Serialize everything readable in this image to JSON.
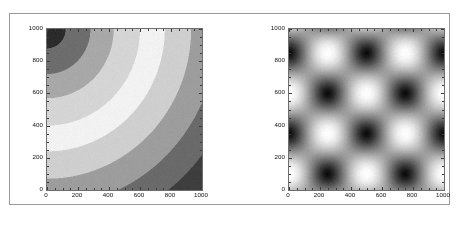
{
  "figure": {
    "background_color": "#ffffff",
    "frame_color": "#9a9a9a",
    "axis_color": "#6e6e6e",
    "tick_label_color": "#111111"
  },
  "panels": [
    {
      "name": "left-contour-panel",
      "xticks": [
        "0",
        "200",
        "400",
        "600",
        "800",
        "1000"
      ],
      "yticks": [
        "0",
        "200",
        "400",
        "600",
        "800",
        "1000"
      ]
    },
    {
      "name": "right-periodic-panel",
      "xticks": [
        "0",
        "200",
        "400",
        "600",
        "800",
        "1000"
      ],
      "yticks": [
        "0",
        "200",
        "400",
        "600",
        "800",
        "1000"
      ]
    }
  ],
  "chart_data": [
    {
      "type": "heatmap",
      "title": "",
      "xlabel": "",
      "ylabel": "",
      "xlim": [
        0,
        1000
      ],
      "ylim": [
        1000,
        0
      ],
      "xticks": [
        0,
        200,
        400,
        600,
        800,
        1000
      ],
      "yticks": [
        0,
        200,
        400,
        600,
        800,
        1000
      ],
      "grid": false,
      "legend": "none",
      "colormap": "gray",
      "quantized_levels": 10,
      "description": "Banded concentric quarter-arc contour field; value increases radially from the lower-left origin, quantized into discrete gray bands from near-white (inner) through mid-gray to near-black (upper-right).",
      "field": {
        "expression": "hypot(x, 1000 - y)",
        "origin": [
          0,
          1000
        ],
        "band_width": 200,
        "levels": [
          {
            "index": 0,
            "radius_range": [
              0,
              120
            ],
            "gray": "#2b2b2b"
          },
          {
            "index": 1,
            "radius_range": [
              120,
              280
            ],
            "gray": "#6d6d6d"
          },
          {
            "index": 2,
            "radius_range": [
              280,
              430
            ],
            "gray": "#a8a8a8"
          },
          {
            "index": 3,
            "radius_range": [
              430,
              600
            ],
            "gray": "#d5d5d5"
          },
          {
            "index": 4,
            "radius_range": [
              600,
              760
            ],
            "gray": "#f2f2f2"
          },
          {
            "index": 5,
            "radius_range": [
              760,
              930
            ],
            "gray": "#cfcfcf"
          },
          {
            "index": 6,
            "radius_range": [
              930,
              1100
            ],
            "gray": "#9d9d9d"
          },
          {
            "index": 7,
            "radius_range": [
              1100,
              1270
            ],
            "gray": "#6a6a6a"
          },
          {
            "index": 8,
            "radius_range": [
              1270,
              1440
            ],
            "gray": "#3e3e3e"
          },
          {
            "index": 9,
            "radius_range": [
              1440,
              2000
            ],
            "gray": "#1c1c1c"
          }
        ]
      }
    },
    {
      "type": "heatmap",
      "title": "",
      "xlabel": "",
      "ylabel": "",
      "xlim": [
        0,
        1000
      ],
      "ylim": [
        1000,
        0
      ],
      "xticks": [
        0,
        200,
        400,
        600,
        800,
        1000
      ],
      "yticks": [
        0,
        200,
        400,
        600,
        800,
        1000
      ],
      "grid": false,
      "legend": "none",
      "colormap": "gray",
      "description": "Smooth doubly-periodic checkerboard field of alternating dark and light blobs; product of two sinusoids with period 500 in x and 500 in y, phase shifted so dark minima and light maxima interleave diagonally.",
      "field": {
        "expression": "cos(2*pi*(x-250)/500) * cos(2*pi*(y-100)/500)",
        "period_x": 500,
        "period_y": 500,
        "phase_x": 250,
        "phase_y": 100,
        "dark_blob_centers": [
          [
            250,
            100
          ],
          [
            750,
            100
          ],
          [
            0,
            350
          ],
          [
            500,
            350
          ],
          [
            1000,
            350
          ],
          [
            250,
            600
          ],
          [
            750,
            600
          ],
          [
            0,
            850
          ],
          [
            500,
            850
          ],
          [
            1000,
            850
          ]
        ],
        "light_blob_centers": [
          [
            0,
            100
          ],
          [
            500,
            100
          ],
          [
            1000,
            100
          ],
          [
            250,
            350
          ],
          [
            750,
            350
          ],
          [
            0,
            600
          ],
          [
            500,
            600
          ],
          [
            1000,
            600
          ],
          [
            250,
            850
          ],
          [
            750,
            850
          ]
        ],
        "min_gray": "#0a0a0a",
        "max_gray": "#ffffff"
      }
    }
  ]
}
